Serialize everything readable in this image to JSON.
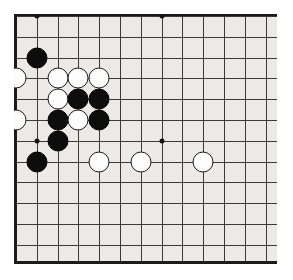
{
  "app": {
    "title": "Go Board Diagram",
    "description": "Go (Weiqi/Baduk) board position diagram, upper-left corner region"
  },
  "board": {
    "name": "go-board",
    "background_color": "#eceae6",
    "line_color": "#3a3a3a",
    "edge_color": "#1a1a1a",
    "black_stone_color": "#0d0d0d",
    "white_stone_color": "#fdfdfd",
    "columns_visible": 13,
    "rows_visible": 12,
    "cell_size_x": 20.8,
    "cell_size_y": 20.8,
    "origin_x": 2,
    "origin_y": 2,
    "stone_radius": 10.5
  },
  "star_points": [
    {
      "col": 3,
      "row": 2,
      "label": "hoshi-upper-left"
    },
    {
      "col": 9,
      "row": 2,
      "label": "hoshi-upper-middle"
    },
    {
      "col": 3,
      "row": 8,
      "label": "hoshi-lower-left"
    },
    {
      "col": 9,
      "row": 8,
      "label": "hoshi-lower-middle"
    }
  ],
  "stones": [
    {
      "color": "black",
      "col": 3,
      "row": 4,
      "label": "black-stone-1"
    },
    {
      "color": "white",
      "col": 2,
      "row": 5,
      "label": "white-stone-1"
    },
    {
      "color": "white",
      "col": 4,
      "row": 5,
      "label": "white-stone-2"
    },
    {
      "color": "white",
      "col": 5,
      "row": 5,
      "label": "white-stone-3"
    },
    {
      "color": "white",
      "col": 6,
      "row": 5,
      "label": "white-stone-4"
    },
    {
      "color": "white",
      "col": 4,
      "row": 6,
      "label": "white-stone-5"
    },
    {
      "color": "black",
      "col": 5,
      "row": 6,
      "label": "black-stone-2"
    },
    {
      "color": "black",
      "col": 6,
      "row": 6,
      "label": "black-stone-3"
    },
    {
      "color": "white",
      "col": 2,
      "row": 7,
      "label": "white-stone-6"
    },
    {
      "color": "black",
      "col": 4,
      "row": 7,
      "label": "black-stone-4"
    },
    {
      "color": "white",
      "col": 5,
      "row": 7,
      "label": "white-stone-7"
    },
    {
      "color": "black",
      "col": 6,
      "row": 7,
      "label": "black-stone-5"
    },
    {
      "color": "black",
      "col": 4,
      "row": 8,
      "label": "black-stone-6"
    },
    {
      "color": "black",
      "col": 3,
      "row": 9,
      "label": "black-stone-7"
    },
    {
      "color": "white",
      "col": 6,
      "row": 9,
      "label": "white-stone-8"
    },
    {
      "color": "white",
      "col": 8,
      "row": 9,
      "label": "white-stone-9"
    },
    {
      "color": "white",
      "col": 11,
      "row": 9,
      "label": "white-stone-10"
    }
  ]
}
